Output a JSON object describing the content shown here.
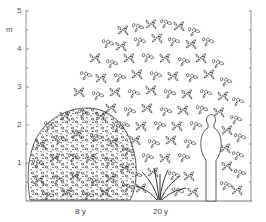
{
  "figure": {
    "title": "",
    "y_axis": {
      "unit": "m",
      "ticks": [
        "1",
        "2",
        "3",
        "4",
        "5"
      ],
      "range": [
        0,
        5
      ],
      "minor_ticks": true
    },
    "right_axis": {
      "labels": false
    },
    "plants": [
      {
        "label": "8 y",
        "age_years": 8,
        "height_m": 2.2,
        "form": "rounded dense shrub"
      },
      {
        "label": "20 y",
        "age_years": 20,
        "height_m": 4.9,
        "form": "broad dome-shaped crown, multi-stemmed base"
      }
    ],
    "scale_figure": {
      "kind": "human silhouette",
      "height_m": 1.8
    },
    "colors": {
      "ink": "#222222",
      "axis": "#777777",
      "background": "#ffffff"
    }
  }
}
